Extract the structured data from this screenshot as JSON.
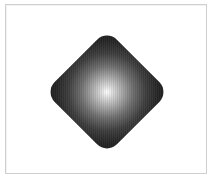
{
  "canvas": {
    "frame_border_color": "#cfcfcf",
    "background_color": "#ffffff"
  },
  "shape": {
    "kind": "rounded-diamond",
    "rotation_deg": 45,
    "fill": "radial-gradient",
    "gradient_center_color": "#ffffff",
    "gradient_edge_color": "#1c1c1c"
  }
}
